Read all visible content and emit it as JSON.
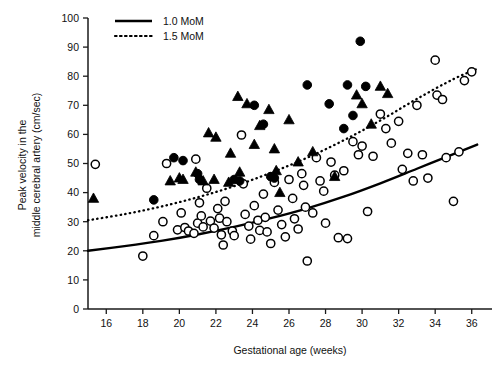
{
  "chart_data": {
    "type": "scatter",
    "title": "",
    "xlabel": "Gestational age (weeks)",
    "ylabel": "Peak velocity in the middle cerebral artery (cm/sec)",
    "xlim": [
      15,
      37
    ],
    "ylim": [
      0,
      100
    ],
    "xticks": [
      16,
      18,
      20,
      22,
      24,
      26,
      28,
      30,
      32,
      34,
      36
    ],
    "yticks": [
      0,
      10,
      20,
      30,
      40,
      50,
      60,
      70,
      80,
      90,
      100
    ],
    "grid": false,
    "legend_position": "top-left",
    "legend": [
      {
        "label": "1.0 MoM",
        "style": "solid",
        "color": "#000000"
      },
      {
        "label": "1.5 MoM",
        "style": "dotted",
        "color": "#000000"
      }
    ],
    "series": [
      {
        "name": "open-circle",
        "marker": "open circle",
        "color": "#000000",
        "points": [
          [
            15.4,
            49.7
          ],
          [
            18.0,
            18.2
          ],
          [
            18.6,
            25.2
          ],
          [
            19.1,
            30.0
          ],
          [
            19.3,
            50.0
          ],
          [
            19.9,
            27.2
          ],
          [
            20.1,
            33.0
          ],
          [
            20.3,
            28.0
          ],
          [
            20.5,
            26.8
          ],
          [
            20.8,
            26.0
          ],
          [
            20.9,
            51.5
          ],
          [
            21.0,
            29.5
          ],
          [
            21.1,
            36.5
          ],
          [
            21.2,
            32.0
          ],
          [
            21.3,
            28.2
          ],
          [
            21.5,
            41.5
          ],
          [
            21.7,
            30.2
          ],
          [
            21.9,
            27.8
          ],
          [
            22.1,
            34.5
          ],
          [
            22.2,
            31.2
          ],
          [
            22.3,
            25.5
          ],
          [
            22.4,
            22.0
          ],
          [
            22.5,
            37.0
          ],
          [
            22.6,
            30.0
          ],
          [
            22.9,
            26.8
          ],
          [
            23.0,
            25.2
          ],
          [
            23.4,
            59.8
          ],
          [
            23.5,
            43.0
          ],
          [
            23.6,
            32.5
          ],
          [
            23.8,
            28.5
          ],
          [
            23.9,
            24.0
          ],
          [
            24.1,
            35.5
          ],
          [
            24.3,
            30.5
          ],
          [
            24.4,
            27.0
          ],
          [
            24.6,
            39.5
          ],
          [
            24.7,
            31.5
          ],
          [
            24.8,
            26.5
          ],
          [
            25.0,
            22.5
          ],
          [
            25.2,
            43.5
          ],
          [
            25.4,
            34.0
          ],
          [
            25.6,
            29.0
          ],
          [
            25.8,
            24.8
          ],
          [
            26.0,
            44.5
          ],
          [
            26.2,
            38.0
          ],
          [
            26.3,
            31.0
          ],
          [
            26.5,
            27.5
          ],
          [
            26.7,
            46.5
          ],
          [
            26.8,
            42.5
          ],
          [
            26.9,
            35.0
          ],
          [
            27.0,
            16.5
          ],
          [
            27.3,
            33.0
          ],
          [
            27.5,
            52.0
          ],
          [
            27.7,
            44.0
          ],
          [
            27.9,
            40.5
          ],
          [
            28.0,
            29.5
          ],
          [
            28.3,
            50.5
          ],
          [
            28.5,
            46.0
          ],
          [
            28.7,
            24.5
          ],
          [
            29.0,
            47.5
          ],
          [
            29.2,
            24.2
          ],
          [
            29.5,
            57.5
          ],
          [
            29.8,
            53.0
          ],
          [
            30.0,
            56.0
          ],
          [
            30.3,
            33.5
          ],
          [
            30.6,
            52.5
          ],
          [
            31.0,
            67.0
          ],
          [
            31.3,
            62.0
          ],
          [
            31.6,
            57.0
          ],
          [
            32.0,
            64.5
          ],
          [
            32.2,
            48.0
          ],
          [
            32.5,
            53.5
          ],
          [
            32.8,
            44.0
          ],
          [
            33.0,
            70.0
          ],
          [
            33.3,
            53.0
          ],
          [
            33.6,
            45.0
          ],
          [
            34.0,
            85.5
          ],
          [
            34.1,
            73.5
          ],
          [
            34.4,
            72.0
          ],
          [
            34.6,
            52.0
          ],
          [
            35.0,
            37.0
          ],
          [
            35.3,
            54.0
          ],
          [
            35.6,
            78.5
          ],
          [
            36.0,
            81.5
          ]
        ]
      },
      {
        "name": "filled-circle",
        "marker": "filled circle",
        "color": "#000000",
        "points": [
          [
            18.6,
            37.5
          ],
          [
            19.7,
            52.0
          ],
          [
            20.2,
            51.0
          ],
          [
            21.0,
            46.5
          ],
          [
            21.1,
            44.5
          ],
          [
            23.0,
            44.5
          ],
          [
            23.3,
            44.0
          ],
          [
            24.1,
            70.0
          ],
          [
            24.6,
            63.5
          ],
          [
            25.0,
            45.5
          ],
          [
            25.2,
            45.0
          ],
          [
            27.0,
            77.0
          ],
          [
            28.2,
            70.5
          ],
          [
            29.0,
            62.0
          ],
          [
            29.2,
            77.0
          ],
          [
            29.5,
            66.5
          ],
          [
            29.9,
            92.0
          ],
          [
            30.2,
            76.5
          ]
        ]
      },
      {
        "name": "filled-triangle",
        "marker": "filled triangle",
        "color": "#000000",
        "points": [
          [
            15.3,
            38.0
          ],
          [
            19.5,
            44.0
          ],
          [
            20.0,
            45.0
          ],
          [
            20.2,
            44.5
          ],
          [
            20.9,
            47.0
          ],
          [
            21.3,
            44.0
          ],
          [
            21.6,
            60.5
          ],
          [
            21.9,
            44.5
          ],
          [
            22.0,
            59.0
          ],
          [
            22.7,
            43.5
          ],
          [
            22.8,
            53.5
          ],
          [
            23.2,
            73.0
          ],
          [
            23.3,
            47.0
          ],
          [
            23.7,
            70.5
          ],
          [
            24.1,
            56.5
          ],
          [
            24.4,
            63.0
          ],
          [
            24.9,
            68.5
          ],
          [
            25.2,
            55.0
          ],
          [
            25.3,
            47.5
          ],
          [
            25.5,
            40.0
          ],
          [
            26.0,
            65.0
          ],
          [
            26.5,
            50.5
          ],
          [
            27.3,
            54.0
          ],
          [
            28.5,
            45.5
          ],
          [
            29.7,
            73.5
          ],
          [
            30.0,
            70.5
          ],
          [
            30.5,
            63.5
          ],
          [
            31.0,
            76.5
          ],
          [
            31.4,
            74.0
          ]
        ]
      }
    ],
    "curves": [
      {
        "name": "1.0 MoM",
        "style": "solid",
        "color": "#000000",
        "points": [
          [
            15.0,
            20.0
          ],
          [
            17.0,
            21.6
          ],
          [
            19.0,
            23.4
          ],
          [
            21.0,
            25.6
          ],
          [
            23.0,
            28.2
          ],
          [
            25.0,
            31.2
          ],
          [
            27.0,
            34.6
          ],
          [
            29.0,
            38.6
          ],
          [
            31.0,
            43.2
          ],
          [
            33.0,
            48.2
          ],
          [
            35.0,
            53.2
          ],
          [
            36.3,
            56.5
          ]
        ]
      },
      {
        "name": "1.5 MoM",
        "style": "dotted",
        "color": "#000000",
        "points": [
          [
            15.0,
            30.5
          ],
          [
            17.0,
            32.6
          ],
          [
            19.0,
            35.2
          ],
          [
            21.0,
            38.4
          ],
          [
            23.0,
            42.2
          ],
          [
            25.0,
            46.8
          ],
          [
            27.0,
            52.0
          ],
          [
            29.0,
            58.0
          ],
          [
            31.0,
            64.8
          ],
          [
            33.0,
            72.2
          ],
          [
            35.0,
            79.0
          ],
          [
            36.3,
            82.5
          ]
        ]
      }
    ]
  },
  "axes": {
    "x_title": "Gestational age (weeks)",
    "y_title_line1": "Peak velocity in the",
    "y_title_line2": "middle cerebral artery (cm/sec)",
    "x_tick_labels": [
      "16",
      "18",
      "20",
      "22",
      "24",
      "26",
      "28",
      "30",
      "32",
      "34",
      "36"
    ],
    "y_tick_labels": [
      "0",
      "10",
      "20",
      "30",
      "40",
      "50",
      "60",
      "70",
      "80",
      "90",
      "100"
    ]
  },
  "legend": {
    "items": [
      {
        "label": "1.0 MoM"
      },
      {
        "label": "1.5 MoM"
      }
    ]
  }
}
